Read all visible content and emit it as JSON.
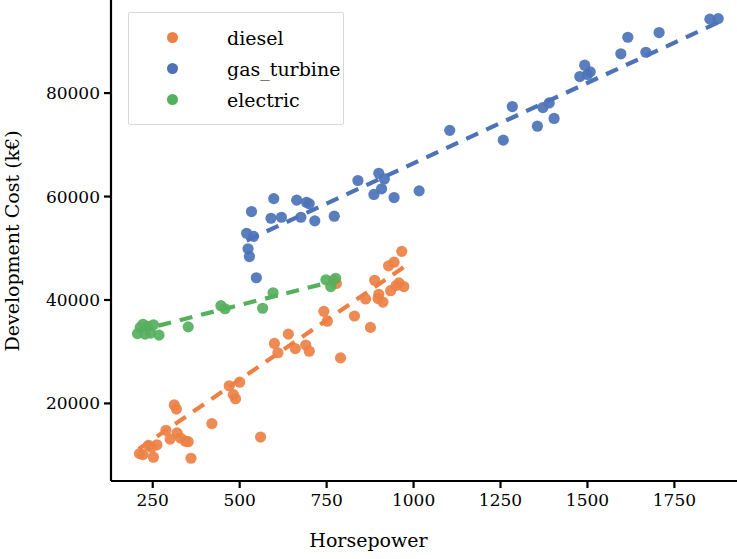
{
  "chart_data": {
    "type": "scatter",
    "title": "",
    "xlabel": "Horsepower",
    "ylabel": "Development Cost (k€)",
    "xlim": [
      130,
      1930
    ],
    "ylim": [
      5000,
      98000
    ],
    "xticks": [
      250,
      500,
      750,
      1000,
      1250,
      1500,
      1750
    ],
    "yticks": [
      20000,
      40000,
      60000,
      80000
    ],
    "grid": false,
    "legend_position": "upper left",
    "legend_entries": [
      "diesel",
      "gas_turbine",
      "electric"
    ],
    "colors": {
      "diesel": "#ED8145",
      "gas_turbine": "#4C72B8",
      "electric": "#55B05C"
    },
    "series": [
      {
        "name": "diesel",
        "color": "#ED8145",
        "trendline": {
          "x": [
            210,
            975
          ],
          "y": [
            11200,
            46500
          ]
        },
        "points": [
          {
            "x": 212,
            "y": 10300
          },
          {
            "x": 222,
            "y": 10100
          },
          {
            "x": 238,
            "y": 11900
          },
          {
            "x": 246,
            "y": 11500
          },
          {
            "x": 252,
            "y": 9600
          },
          {
            "x": 262,
            "y": 12000
          },
          {
            "x": 288,
            "y": 14800
          },
          {
            "x": 300,
            "y": 13100
          },
          {
            "x": 312,
            "y": 19700
          },
          {
            "x": 318,
            "y": 18900
          },
          {
            "x": 320,
            "y": 14300
          },
          {
            "x": 330,
            "y": 13300
          },
          {
            "x": 344,
            "y": 12700
          },
          {
            "x": 352,
            "y": 12600
          },
          {
            "x": 360,
            "y": 9400
          },
          {
            "x": 420,
            "y": 16100
          },
          {
            "x": 470,
            "y": 23400
          },
          {
            "x": 482,
            "y": 21700
          },
          {
            "x": 488,
            "y": 20900
          },
          {
            "x": 500,
            "y": 24100
          },
          {
            "x": 560,
            "y": 13500
          },
          {
            "x": 600,
            "y": 31600
          },
          {
            "x": 610,
            "y": 29800
          },
          {
            "x": 640,
            "y": 33400
          },
          {
            "x": 660,
            "y": 30600
          },
          {
            "x": 690,
            "y": 31300
          },
          {
            "x": 700,
            "y": 30100
          },
          {
            "x": 742,
            "y": 37800
          },
          {
            "x": 752,
            "y": 35900
          },
          {
            "x": 770,
            "y": 43800
          },
          {
            "x": 778,
            "y": 43200
          },
          {
            "x": 790,
            "y": 28800
          },
          {
            "x": 830,
            "y": 36900
          },
          {
            "x": 862,
            "y": 40200
          },
          {
            "x": 876,
            "y": 34700
          },
          {
            "x": 888,
            "y": 43800
          },
          {
            "x": 898,
            "y": 40300
          },
          {
            "x": 900,
            "y": 41100
          },
          {
            "x": 912,
            "y": 39600
          },
          {
            "x": 928,
            "y": 46600
          },
          {
            "x": 934,
            "y": 41800
          },
          {
            "x": 944,
            "y": 47300
          },
          {
            "x": 950,
            "y": 42800
          },
          {
            "x": 958,
            "y": 43300
          },
          {
            "x": 966,
            "y": 49400
          },
          {
            "x": 972,
            "y": 42600
          }
        ]
      },
      {
        "name": "gas_turbine",
        "color": "#4C72B8",
        "trendline": {
          "x": [
            520,
            1880
          ],
          "y": [
            51500,
            93800
          ]
        },
        "points": [
          {
            "x": 520,
            "y": 52900
          },
          {
            "x": 524,
            "y": 49900
          },
          {
            "x": 528,
            "y": 48400
          },
          {
            "x": 534,
            "y": 57100
          },
          {
            "x": 540,
            "y": 52300
          },
          {
            "x": 548,
            "y": 44300
          },
          {
            "x": 590,
            "y": 55800
          },
          {
            "x": 598,
            "y": 59600
          },
          {
            "x": 620,
            "y": 56000
          },
          {
            "x": 664,
            "y": 59300
          },
          {
            "x": 676,
            "y": 56000
          },
          {
            "x": 692,
            "y": 58900
          },
          {
            "x": 700,
            "y": 58600
          },
          {
            "x": 716,
            "y": 55300
          },
          {
            "x": 772,
            "y": 56200
          },
          {
            "x": 840,
            "y": 63100
          },
          {
            "x": 886,
            "y": 60400
          },
          {
            "x": 900,
            "y": 64500
          },
          {
            "x": 908,
            "y": 61500
          },
          {
            "x": 916,
            "y": 63400
          },
          {
            "x": 944,
            "y": 59800
          },
          {
            "x": 1016,
            "y": 61100
          },
          {
            "x": 1104,
            "y": 72800
          },
          {
            "x": 1258,
            "y": 70900
          },
          {
            "x": 1284,
            "y": 77400
          },
          {
            "x": 1356,
            "y": 73600
          },
          {
            "x": 1372,
            "y": 77200
          },
          {
            "x": 1390,
            "y": 78100
          },
          {
            "x": 1404,
            "y": 75100
          },
          {
            "x": 1478,
            "y": 83200
          },
          {
            "x": 1492,
            "y": 85400
          },
          {
            "x": 1500,
            "y": 83600
          },
          {
            "x": 1508,
            "y": 84100
          },
          {
            "x": 1596,
            "y": 87600
          },
          {
            "x": 1616,
            "y": 90800
          },
          {
            "x": 1668,
            "y": 87900
          },
          {
            "x": 1706,
            "y": 91700
          },
          {
            "x": 1852,
            "y": 94300
          },
          {
            "x": 1876,
            "y": 94400
          }
        ]
      },
      {
        "name": "electric",
        "color": "#55B05C",
        "trendline": {
          "x": [
            205,
            775
          ],
          "y": [
            34000,
            43700
          ]
        },
        "points": [
          {
            "x": 206,
            "y": 33500
          },
          {
            "x": 214,
            "y": 34700
          },
          {
            "x": 222,
            "y": 35300
          },
          {
            "x": 228,
            "y": 33400
          },
          {
            "x": 236,
            "y": 34900
          },
          {
            "x": 244,
            "y": 33600
          },
          {
            "x": 252,
            "y": 35200
          },
          {
            "x": 268,
            "y": 33200
          },
          {
            "x": 352,
            "y": 34800
          },
          {
            "x": 446,
            "y": 38900
          },
          {
            "x": 458,
            "y": 38300
          },
          {
            "x": 566,
            "y": 38400
          },
          {
            "x": 596,
            "y": 41400
          },
          {
            "x": 748,
            "y": 43900
          },
          {
            "x": 762,
            "y": 42600
          },
          {
            "x": 776,
            "y": 44200
          }
        ]
      }
    ]
  },
  "axes": {
    "xlabel": "Horsepower",
    "ylabel": "Development Cost (k€)",
    "xticklabels": [
      "250",
      "500",
      "750",
      "1000",
      "1250",
      "1500",
      "1750"
    ],
    "yticklabels": [
      "20000",
      "40000",
      "60000",
      "80000"
    ]
  },
  "legend": {
    "items": [
      {
        "label": "diesel",
        "color": "#ED8145"
      },
      {
        "label": "gas_turbine",
        "color": "#4C72B8"
      },
      {
        "label": "electric",
        "color": "#55B05C"
      }
    ]
  }
}
